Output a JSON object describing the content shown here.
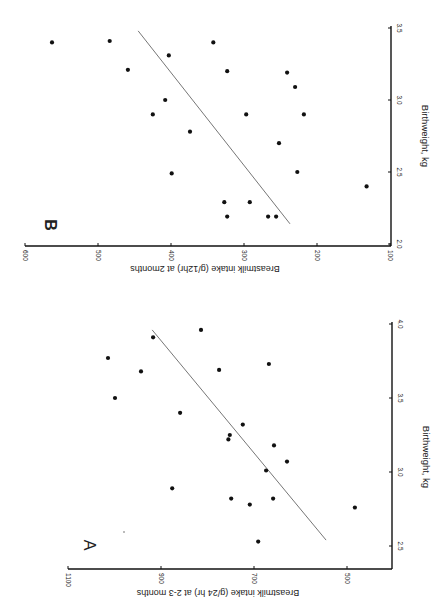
{
  "figure": {
    "background": "#ffffff",
    "ink": "#111111",
    "line_color": "#555555"
  },
  "chart_data": [
    {
      "panel": "A",
      "type": "scatter",
      "title": "",
      "panel_label": "A",
      "xlabel": "Birthweight, kg",
      "ylabel": "Breastmilk intake (g/24 hr) at 2-3 months",
      "xlim": [
        2.35,
        4.0
      ],
      "ylim": [
        400,
        1100
      ],
      "xticks": [
        2.5,
        3.0,
        3.5,
        4.0
      ],
      "xtick_labels": [
        "2.5",
        "3.0",
        "3.5",
        "4.0"
      ],
      "yticks": [
        500,
        700,
        900,
        1100
      ],
      "ytick_labels": [
        "500",
        "700",
        "900",
        "1100"
      ],
      "grid": false,
      "points": [
        {
          "x": 3.77,
          "y": 1014
        },
        {
          "x": 3.91,
          "y": 917
        },
        {
          "x": 3.68,
          "y": 943
        },
        {
          "x": 3.5,
          "y": 999
        },
        {
          "x": 3.96,
          "y": 814
        },
        {
          "x": 3.69,
          "y": 775
        },
        {
          "x": 3.73,
          "y": 668
        },
        {
          "x": 3.4,
          "y": 859
        },
        {
          "x": 3.32,
          "y": 724
        },
        {
          "x": 3.25,
          "y": 752
        },
        {
          "x": 3.22,
          "y": 755
        },
        {
          "x": 3.18,
          "y": 657
        },
        {
          "x": 3.07,
          "y": 629
        },
        {
          "x": 3.01,
          "y": 674
        },
        {
          "x": 2.89,
          "y": 876
        },
        {
          "x": 2.82,
          "y": 749
        },
        {
          "x": 2.78,
          "y": 709
        },
        {
          "x": 2.82,
          "y": 659
        },
        {
          "x": 2.76,
          "y": 483
        },
        {
          "x": 2.53,
          "y": 691
        }
      ],
      "regression_line": {
        "x1": 3.96,
        "y1": 919,
        "x2": 2.54,
        "y2": 545
      }
    },
    {
      "panel": "B",
      "type": "scatter",
      "title": "",
      "panel_label": "B",
      "xlabel": "Birthweight, kg",
      "ylabel": "Breastmilk intake (g/12hr) at 2months",
      "xlim": [
        2.0,
        3.5
      ],
      "ylim": [
        100,
        600
      ],
      "xticks": [
        2.0,
        2.5,
        3.0,
        3.5
      ],
      "xtick_labels": [
        "2.0",
        "2.5",
        "3.0",
        "3.5"
      ],
      "yticks": [
        100,
        200,
        300,
        400,
        500,
        600
      ],
      "ytick_labels": [
        "100",
        "200",
        "300",
        "400",
        "500",
        "600"
      ],
      "grid": false,
      "points": [
        {
          "x": 3.4,
          "y": 563
        },
        {
          "x": 3.41,
          "y": 484
        },
        {
          "x": 3.21,
          "y": 459
        },
        {
          "x": 3.31,
          "y": 403
        },
        {
          "x": 3.4,
          "y": 342
        },
        {
          "x": 3.2,
          "y": 323
        },
        {
          "x": 3.19,
          "y": 241
        },
        {
          "x": 3.09,
          "y": 230
        },
        {
          "x": 3.0,
          "y": 408
        },
        {
          "x": 2.9,
          "y": 425
        },
        {
          "x": 2.9,
          "y": 297
        },
        {
          "x": 2.9,
          "y": 218
        },
        {
          "x": 2.78,
          "y": 374
        },
        {
          "x": 2.7,
          "y": 252
        },
        {
          "x": 2.49,
          "y": 399
        },
        {
          "x": 2.5,
          "y": 227
        },
        {
          "x": 2.4,
          "y": 132
        },
        {
          "x": 2.29,
          "y": 327
        },
        {
          "x": 2.29,
          "y": 292
        },
        {
          "x": 2.19,
          "y": 323
        },
        {
          "x": 2.19,
          "y": 267
        },
        {
          "x": 2.19,
          "y": 256
        }
      ],
      "regression_line": {
        "x1": 3.48,
        "y1": 445,
        "x2": 2.14,
        "y2": 237
      }
    }
  ]
}
